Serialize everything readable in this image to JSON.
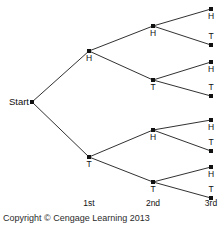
{
  "figure": {
    "background_color": "#ffffff",
    "line_color": "#1a1a1a",
    "node_color": "#111111",
    "text_color": "#111111"
  },
  "start": {
    "label": "Start",
    "x": 32,
    "y": 102,
    "label_x": 29,
    "label_y": 105
  },
  "stage_labels": [
    {
      "text": "1st",
      "x": 89,
      "y": 206
    },
    {
      "text": "2nd",
      "x": 153,
      "y": 206
    },
    {
      "text": "3rd",
      "x": 211,
      "y": 206
    }
  ],
  "copyright": {
    "text": "Copyright © Cengage Learning 2013",
    "x": 3,
    "y": 221
  },
  "nodes": {
    "level1": [
      {
        "id": "H",
        "label": "H",
        "x": 89,
        "y": 51,
        "label_x": 89,
        "label_y": 61,
        "label_pos": "below"
      },
      {
        "id": "T",
        "label": "T",
        "x": 89,
        "y": 157,
        "label_x": 89,
        "label_y": 167,
        "label_pos": "below"
      }
    ],
    "level2": [
      {
        "id": "HH",
        "label": "H",
        "x": 153,
        "y": 26,
        "label_x": 153,
        "label_y": 36,
        "label_pos": "below"
      },
      {
        "id": "HT",
        "label": "T",
        "x": 153,
        "y": 80,
        "label_x": 153,
        "label_y": 90,
        "label_pos": "below"
      },
      {
        "id": "TH",
        "label": "H",
        "x": 153,
        "y": 130,
        "label_x": 153,
        "label_y": 140,
        "label_pos": "below"
      },
      {
        "id": "TT",
        "label": "T",
        "x": 153,
        "y": 182,
        "label_x": 153,
        "label_y": 192,
        "label_pos": "below"
      }
    ],
    "level3": [
      {
        "id": "HHH",
        "label": "H",
        "x": 211,
        "y": 9,
        "label_x": 211,
        "label_y": 19,
        "label_pos": "below"
      },
      {
        "id": "HHT",
        "label": "T",
        "x": 211,
        "y": 45,
        "label_x": 211,
        "label_y": 39,
        "label_pos": "above"
      },
      {
        "id": "HTH",
        "label": "H",
        "x": 211,
        "y": 62,
        "label_x": 211,
        "label_y": 72,
        "label_pos": "below"
      },
      {
        "id": "HTT",
        "label": "T",
        "x": 211,
        "y": 96,
        "label_x": 211,
        "label_y": 90,
        "label_pos": "above"
      },
      {
        "id": "THH",
        "label": "H",
        "x": 211,
        "y": 120,
        "label_x": 211,
        "label_y": 130,
        "label_pos": "below"
      },
      {
        "id": "THT",
        "label": "T",
        "x": 211,
        "y": 151,
        "label_x": 211,
        "label_y": 145,
        "label_pos": "above"
      },
      {
        "id": "TTH",
        "label": "H",
        "x": 211,
        "y": 167,
        "label_x": 211,
        "label_y": 177,
        "label_pos": "below"
      },
      {
        "id": "TTT",
        "label": "T",
        "x": 211,
        "y": 198,
        "label_x": 211,
        "label_y": 192,
        "label_pos": "above"
      }
    ]
  },
  "edges": [
    {
      "from": "Start",
      "to": "H",
      "x1": 32,
      "y1": 102,
      "x2": 89,
      "y2": 51
    },
    {
      "from": "Start",
      "to": "T",
      "x1": 32,
      "y1": 102,
      "x2": 89,
      "y2": 157
    },
    {
      "from": "H",
      "to": "HH",
      "x1": 89,
      "y1": 51,
      "x2": 153,
      "y2": 26
    },
    {
      "from": "H",
      "to": "HT",
      "x1": 89,
      "y1": 51,
      "x2": 153,
      "y2": 80
    },
    {
      "from": "T",
      "to": "TH",
      "x1": 89,
      "y1": 157,
      "x2": 153,
      "y2": 130
    },
    {
      "from": "T",
      "to": "TT",
      "x1": 89,
      "y1": 157,
      "x2": 153,
      "y2": 182
    },
    {
      "from": "HH",
      "to": "HHH",
      "x1": 153,
      "y1": 26,
      "x2": 211,
      "y2": 9
    },
    {
      "from": "HH",
      "to": "HHT",
      "x1": 153,
      "y1": 26,
      "x2": 211,
      "y2": 45
    },
    {
      "from": "HT",
      "to": "HTH",
      "x1": 153,
      "y1": 80,
      "x2": 211,
      "y2": 62
    },
    {
      "from": "HT",
      "to": "HTT",
      "x1": 153,
      "y1": 80,
      "x2": 211,
      "y2": 96
    },
    {
      "from": "TH",
      "to": "THH",
      "x1": 153,
      "y1": 130,
      "x2": 211,
      "y2": 120
    },
    {
      "from": "TH",
      "to": "THT",
      "x1": 153,
      "y1": 130,
      "x2": 211,
      "y2": 151
    },
    {
      "from": "TT",
      "to": "TTH",
      "x1": 153,
      "y1": 182,
      "x2": 211,
      "y2": 167
    },
    {
      "from": "TT",
      "to": "TTT",
      "x1": 153,
      "y1": 182,
      "x2": 211,
      "y2": 198
    }
  ]
}
